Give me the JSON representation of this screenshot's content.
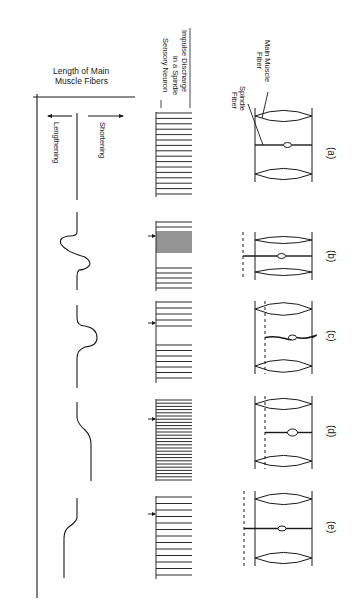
{
  "figure": {
    "orientation": "rotated-90-clockwise",
    "length_axis": {
      "title_line1": "Length of Main",
      "title_line2": "Muscle Fibers",
      "shortening_label": "Shortening",
      "lengthening_label": "Lengthening"
    },
    "impulse_axis": {
      "title_line1": "Impulse Discharge",
      "title_line2": "in a Spindle",
      "title_line3": "Sensory Neuron"
    },
    "fiber_labels": {
      "main_muscle_line1": "Main Muscle",
      "main_muscle_line2": "Fiber",
      "spindle_line1": "Spindle",
      "spindle_line2": "Fiber"
    },
    "panels": [
      {
        "label": "(a)",
        "state": "resting",
        "impulse_pattern": "steady",
        "length_change": "none"
      },
      {
        "label": "(b)",
        "state": "main fibers contract (shorten)",
        "impulse_pattern": "burst then pause then resume",
        "length_change": "shortening then return"
      },
      {
        "label": "(c)",
        "state": "main fibers stretched (lengthen) then return",
        "impulse_pattern": "pause then resume",
        "length_change": "lengthening then return"
      },
      {
        "label": "(d)",
        "state": "spindle contracts with main fiber shortening",
        "impulse_pattern": "steady high rate",
        "length_change": "sustained shortening"
      },
      {
        "label": "(e)",
        "state": "sustained lengthening",
        "impulse_pattern": "steady",
        "length_change": "sustained lengthening"
      }
    ]
  }
}
